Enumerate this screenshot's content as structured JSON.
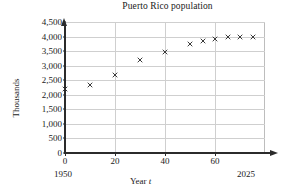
{
  "chart_data": {
    "type": "scatter",
    "title": "Puerto Rico population",
    "xlabel": "Year t",
    "ylabel": "Thousands",
    "xlim": [
      0,
      80
    ],
    "ylim": [
      0,
      4500
    ],
    "grid": true,
    "legend": "none",
    "marker": "x",
    "x_tick_labels": [
      "0",
      "20",
      "40",
      "60"
    ],
    "x_ticks": [
      0,
      20,
      40,
      60
    ],
    "y_tick_labels": [
      "0",
      "500",
      "1,000",
      "1,500",
      "2,000",
      "2,500",
      "3,000",
      "3,500",
      "4,000",
      "4,500"
    ],
    "y_ticks": [
      0,
      500,
      1000,
      1500,
      2000,
      2500,
      3000,
      3500,
      4000,
      4500
    ],
    "axis_start_year": "1950",
    "axis_end_year": "2025",
    "points": [
      {
        "x": 0,
        "y": 2210
      },
      {
        "x": 10,
        "y": 2350
      },
      {
        "x": 20,
        "y": 2690
      },
      {
        "x": 30,
        "y": 3200
      },
      {
        "x": 40,
        "y": 3470
      },
      {
        "x": 50,
        "y": 3760
      },
      {
        "x": 55,
        "y": 3860
      },
      {
        "x": 60,
        "y": 3930
      },
      {
        "x": 65,
        "y": 3970
      },
      {
        "x": 70,
        "y": 4000
      },
      {
        "x": 75,
        "y": 3990
      }
    ]
  }
}
